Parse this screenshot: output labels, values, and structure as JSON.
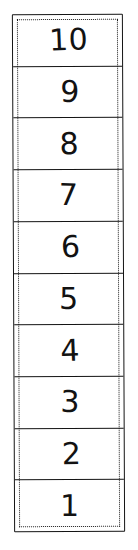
{
  "diagram": {
    "style": "hand-drawn",
    "orientation": "vertical",
    "row_count": 10,
    "border": {
      "outer_style": "solid",
      "inner_style": "dotted",
      "color": "#141414"
    },
    "colors": {
      "ink": "#141414",
      "paper": "#ffffff",
      "label": "#121212"
    },
    "rows": [
      {
        "label": "10",
        "value": 10
      },
      {
        "label": "9",
        "value": 9
      },
      {
        "label": "8",
        "value": 8
      },
      {
        "label": "7",
        "value": 7
      },
      {
        "label": "6",
        "value": 6
      },
      {
        "label": "5",
        "value": 5
      },
      {
        "label": "4",
        "value": 4
      },
      {
        "label": "3",
        "value": 3
      },
      {
        "label": "2",
        "value": 2
      },
      {
        "label": "1",
        "value": 1
      }
    ]
  }
}
